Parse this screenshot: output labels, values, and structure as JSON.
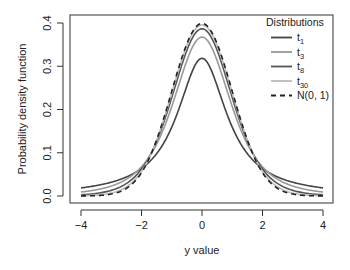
{
  "chart_data": {
    "type": "line",
    "title": "",
    "xlabel": "y value",
    "ylabel": "Probability density function",
    "xlim": [
      -4,
      4
    ],
    "ylim": [
      0,
      0.4
    ],
    "xticks": [
      -4,
      -2,
      0,
      2,
      4
    ],
    "xtick_labels": [
      "−4",
      "−2",
      "0",
      "2",
      "4"
    ],
    "yticks": [
      0.0,
      0.1,
      0.2,
      0.3,
      0.4
    ],
    "ytick_labels": [
      "0.0",
      "0.1",
      "0.2",
      "0.3",
      "0.4"
    ],
    "grid": false,
    "legend": {
      "title": "Distributions",
      "position": "top-right",
      "entries": [
        {
          "label": "t",
          "sub": "1",
          "color": "#444444",
          "dash": "solid"
        },
        {
          "label": "t",
          "sub": "3",
          "color": "#999999",
          "dash": "solid"
        },
        {
          "label": "t",
          "sub": "8",
          "color": "#555555",
          "dash": "solid"
        },
        {
          "label": "t",
          "sub": "30",
          "color": "#bbbbbb",
          "dash": "solid"
        },
        {
          "label": "N(0, 1)",
          "sub": "",
          "color": "#222222",
          "dash": "dashed"
        }
      ]
    },
    "series": [
      {
        "name": "t1",
        "distribution": "student-t",
        "df": 1,
        "color": "#444444",
        "dash": "solid",
        "peak": 0.318
      },
      {
        "name": "t3",
        "distribution": "student-t",
        "df": 3,
        "color": "#999999",
        "dash": "solid",
        "peak": 0.368
      },
      {
        "name": "t8",
        "distribution": "student-t",
        "df": 8,
        "color": "#555555",
        "dash": "solid",
        "peak": 0.387
      },
      {
        "name": "t30",
        "distribution": "student-t",
        "df": 30,
        "color": "#bbbbbb",
        "dash": "solid",
        "peak": 0.396
      },
      {
        "name": "N(0, 1)",
        "distribution": "normal",
        "df": null,
        "color": "#222222",
        "dash": "dashed",
        "peak": 0.399
      }
    ],
    "sampled_points": {
      "x": [
        -4,
        -3,
        -2,
        -1,
        0,
        1,
        2,
        3,
        4
      ],
      "t1": [
        0.019,
        0.032,
        0.064,
        0.159,
        0.318,
        0.159,
        0.064,
        0.032,
        0.019
      ],
      "t3": [
        0.009,
        0.023,
        0.068,
        0.207,
        0.368,
        0.207,
        0.068,
        0.023,
        0.009
      ],
      "t8": [
        0.003,
        0.013,
        0.063,
        0.23,
        0.387,
        0.23,
        0.063,
        0.013,
        0.003
      ],
      "t30": [
        0.001,
        0.007,
        0.057,
        0.239,
        0.396,
        0.239,
        0.057,
        0.007,
        0.001
      ],
      "N(0, 1)": [
        0.0001,
        0.004,
        0.054,
        0.242,
        0.399,
        0.242,
        0.054,
        0.004,
        0.0001
      ]
    }
  }
}
